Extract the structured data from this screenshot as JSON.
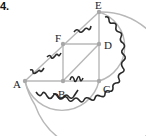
{
  "problem_number": "4.",
  "points": {
    "A": {
      "label": "A",
      "x": 25,
      "y": 81
    },
    "B": {
      "label": "B",
      "x": 63,
      "y": 81
    },
    "C": {
      "label": "C",
      "x": 99,
      "y": 81
    },
    "D": {
      "label": "D",
      "x": 99,
      "y": 44
    },
    "E": {
      "label": "E",
      "x": 99,
      "y": 12
    },
    "F": {
      "label": "F",
      "x": 63,
      "y": 44
    }
  },
  "segments": [
    "AB",
    "BC",
    "CD",
    "DE",
    "FD",
    "FB",
    "BD",
    "AF",
    "FE"
  ],
  "arcs": [
    "A-C (center B)",
    "A-E (center C)",
    "E-C (right semicircle)"
  ],
  "colors": {
    "lines": "#b8b8b8",
    "points": "#a8a8a8",
    "wavy": "#2a2a2a"
  }
}
